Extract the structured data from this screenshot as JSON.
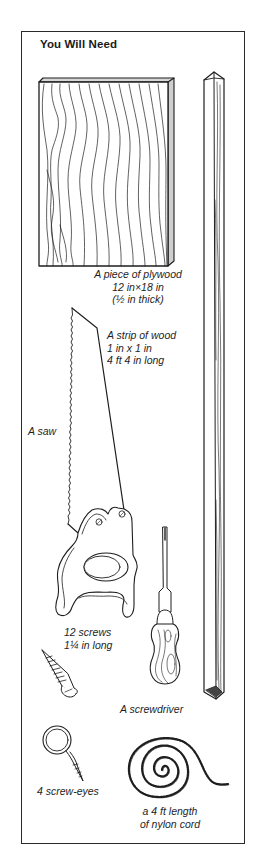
{
  "panel": {
    "title": "You Will Need",
    "items": [
      {
        "id": "plywood",
        "icon": "plywood-board-icon",
        "lines": [
          "A piece of plywood",
          "12 in×18 in",
          "(½ in thick)"
        ]
      },
      {
        "id": "wood-strip",
        "icon": "wood-strip-icon",
        "lines": [
          "A strip of wood",
          "1 in x 1 in",
          "4 ft 4 in long"
        ]
      },
      {
        "id": "saw",
        "icon": "saw-icon",
        "lines": [
          "A saw"
        ]
      },
      {
        "id": "screws",
        "icon": "screw-icon",
        "lines": [
          "12 screws",
          "1¼ in long"
        ]
      },
      {
        "id": "screwdriver",
        "icon": "screwdriver-icon",
        "lines": [
          "A screwdriver"
        ]
      },
      {
        "id": "screw-eyes",
        "icon": "screw-eye-icon",
        "lines": [
          "4 screw-eyes"
        ]
      },
      {
        "id": "nylon-cord",
        "icon": "nylon-cord-coil-icon",
        "lines": [
          "a 4 ft length",
          "of nylon cord"
        ]
      }
    ]
  },
  "colors": {
    "ink": "#1e1e1e",
    "paper": "#ffffff"
  }
}
